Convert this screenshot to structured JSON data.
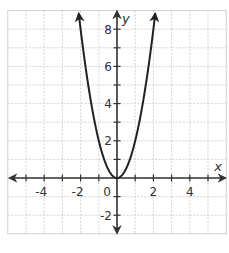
{
  "chart_data": {
    "type": "line",
    "title": "",
    "xlabel": "x",
    "ylabel": "y",
    "xlim": [
      -6,
      6
    ],
    "ylim": [
      -3,
      9
    ],
    "grid": true,
    "x_tick_labels": [
      {
        "value": -4,
        "label": "-4"
      },
      {
        "value": -2,
        "label": "-2"
      },
      {
        "value": 2,
        "label": "2"
      },
      {
        "value": 4,
        "label": "4"
      }
    ],
    "y_tick_labels": [
      {
        "value": 8,
        "label": "8"
      },
      {
        "value": 6,
        "label": "6"
      },
      {
        "value": 4,
        "label": "4"
      },
      {
        "value": 2,
        "label": "2"
      },
      {
        "value": -2,
        "label": "-2"
      }
    ],
    "origin_label": "0",
    "series": [
      {
        "name": "y = 2x^2",
        "equation": "y = 2x^2",
        "x": [
          -2.1,
          -2,
          -1.5,
          -1,
          -0.5,
          0,
          0.5,
          1,
          1.5,
          2,
          2.1
        ],
        "y": [
          8.82,
          8,
          4.5,
          2,
          0.5,
          0,
          0.5,
          2,
          4.5,
          8,
          8.82
        ],
        "color": "#222222",
        "arrows_at_ends": true
      }
    ]
  },
  "colors": {
    "grid": "#c8c8c8",
    "axis": "#333333",
    "curve": "#222222",
    "border": "#cfcfcf"
  }
}
